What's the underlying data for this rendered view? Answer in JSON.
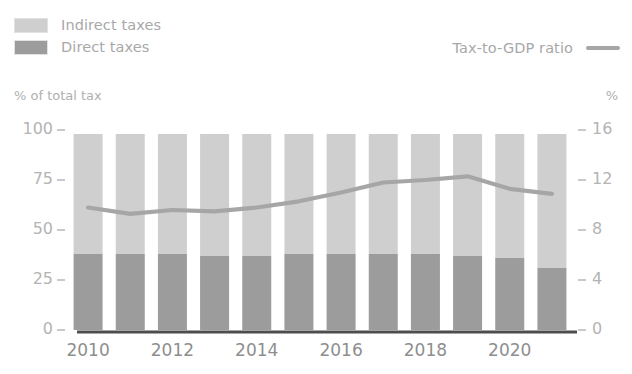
{
  "legend": {
    "items": [
      {
        "label": "Indirect taxes",
        "color": "#cfcfcf",
        "swatch_name": "indirect-taxes-swatch"
      },
      {
        "label": "Direct taxes",
        "color": "#9c9c9c",
        "swatch_name": "direct-taxes-swatch"
      }
    ],
    "line_item": {
      "label": "Tax-to-GDP ratio",
      "color": "#a6a6a6"
    }
  },
  "axis_captions": {
    "left": "% of total tax",
    "right": "%"
  },
  "chart_data": {
    "type": "bar",
    "title": "",
    "xlabel": "",
    "ylabel": "% of total tax",
    "y2label": "%",
    "grid": false,
    "legend_position": "top",
    "categories": [
      "2010",
      "2011",
      "2012",
      "2013",
      "2014",
      "2015",
      "2016",
      "2017",
      "2018",
      "2019",
      "2020",
      "2021"
    ],
    "xtick_labels": [
      "2010",
      "2012",
      "2014",
      "2016",
      "2018",
      "2020"
    ],
    "xtick_categories": [
      "2010",
      "2012",
      "2014",
      "2016",
      "2018",
      "2020"
    ],
    "ylim": [
      0,
      100
    ],
    "ytick_labels": [
      "100",
      "75",
      "50",
      "25",
      "0"
    ],
    "yticks": [
      100,
      75,
      50,
      25,
      0
    ],
    "y2lim": [
      0,
      16
    ],
    "y2tick_labels": [
      "16",
      "12",
      "8",
      "4",
      "0"
    ],
    "y2ticks": [
      16,
      12,
      8,
      4,
      0
    ],
    "stacked": true,
    "series": [
      {
        "name": "Direct taxes",
        "color": "#9c9c9c",
        "axis": "left",
        "values": [
          38,
          38,
          38,
          37,
          37,
          38,
          38,
          38,
          38,
          37,
          36,
          31
        ]
      },
      {
        "name": "Indirect taxes",
        "color": "#cfcfcf",
        "axis": "left",
        "values": [
          60,
          60,
          60,
          61,
          61,
          60,
          60,
          60,
          60,
          61,
          62,
          67
        ]
      }
    ],
    "bar_totals": [
      98,
      98,
      98,
      98,
      98,
      98,
      98,
      98,
      98,
      98,
      98,
      98
    ],
    "line_series": {
      "name": "Tax-to-GDP ratio",
      "color": "#a6a6a6",
      "axis": "right",
      "values": [
        9.8,
        9.3,
        9.6,
        9.5,
        9.8,
        10.3,
        11.0,
        11.8,
        12.0,
        12.3,
        11.3,
        10.9
      ]
    }
  }
}
